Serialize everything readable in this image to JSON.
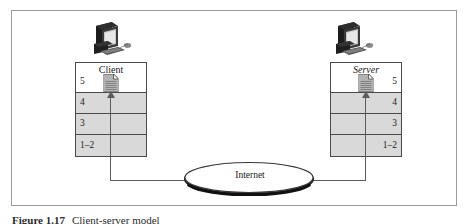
{
  "figure": {
    "caption_number": "Figure 1.17",
    "caption_text": "Client-server model",
    "internet_label": "Internet"
  },
  "client": {
    "title": "Client",
    "icon": "desktop-computer-icon",
    "document_icon": "document-page-icon",
    "tiers": [
      {
        "label": "5"
      },
      {
        "label": "4"
      },
      {
        "label": "3"
      },
      {
        "label": "1–2"
      }
    ]
  },
  "server": {
    "title": "Server",
    "icon": "desktop-computer-icon",
    "document_icon": "document-page-icon",
    "tiers": [
      {
        "label": "5"
      },
      {
        "label": "4"
      },
      {
        "label": "3"
      },
      {
        "label": "1–2"
      }
    ]
  },
  "colors": {
    "frame": "#9b9b9b",
    "stack_border": "#4a4a4a",
    "tier_fill": "#d9d9d9",
    "top_tier_fill": "#ffffff",
    "line": "#5c5c5c",
    "text": "#1a1a1a",
    "background": "#ffffff"
  }
}
